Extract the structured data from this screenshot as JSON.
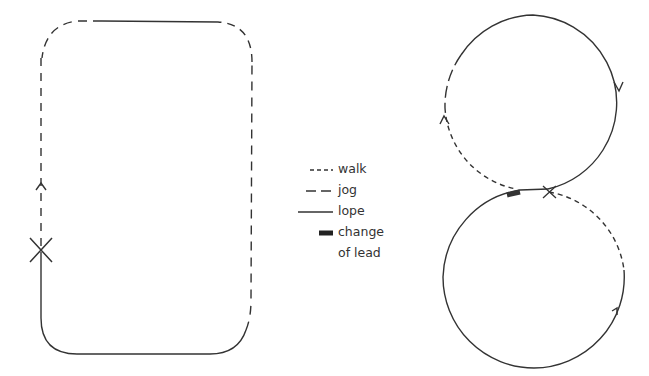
{
  "diagram": {
    "type": "riding-pattern-diagram",
    "colors": {
      "line": "#333333",
      "background": "#ffffff"
    },
    "patterns": [
      {
        "name": "rectangle-pattern",
        "shape": "rounded-rectangle",
        "start_marker": "X",
        "direction_arrows": 1,
        "segments": [
          {
            "gait": "lope",
            "where": "left side below X and bottom edge"
          },
          {
            "gait": "jog",
            "where": "bottom-right corner and right side"
          },
          {
            "gait": "jog",
            "where": "top corners and top-left"
          },
          {
            "gait": "lope",
            "where": "middle of top edge"
          },
          {
            "gait": "jog",
            "where": "left side above X"
          }
        ]
      },
      {
        "name": "figure-eight-pattern",
        "shape": "figure-eight",
        "start_marker": "X",
        "direction_arrows": 3,
        "change_of_lead_marker": true,
        "segments": [
          {
            "gait": "walk",
            "where": "from X along right side of lower circle"
          },
          {
            "gait": "lope",
            "where": "lower circle"
          },
          {
            "gait": "lope",
            "where": "upper circle right side"
          },
          {
            "gait": "jog",
            "where": "upper circle left side"
          },
          {
            "gait": "walk",
            "where": "upper circle lower-left back to center"
          }
        ]
      }
    ]
  },
  "legend": {
    "items": [
      {
        "key": "walk",
        "label": "walk",
        "style": "short-dash"
      },
      {
        "key": "jog",
        "label": "jog",
        "style": "long-dash"
      },
      {
        "key": "lope",
        "label": "lope",
        "style": "solid"
      },
      {
        "key": "change_of_lead",
        "label": "change",
        "label_line2": "of lead",
        "style": "thick-bar"
      }
    ]
  }
}
